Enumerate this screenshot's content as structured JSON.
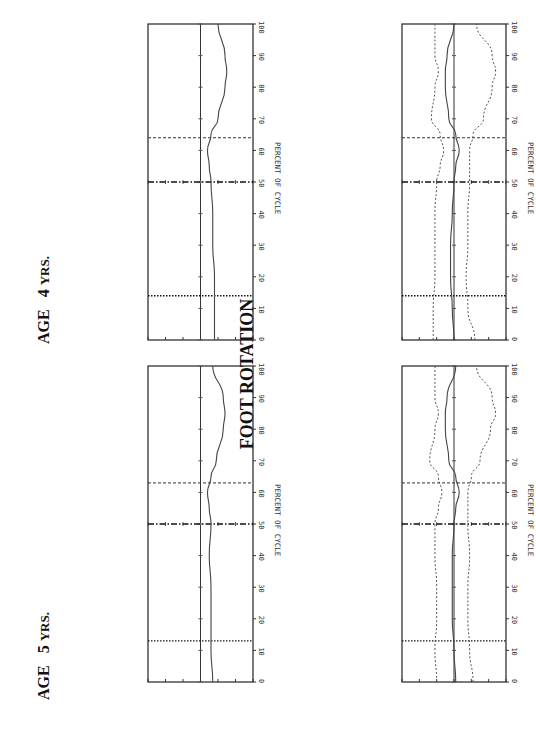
{
  "title": "FOOT ROTATION",
  "age_labels": [
    {
      "age": "AGE",
      "value": "4",
      "unit": "YRS."
    },
    {
      "age": "AGE",
      "value": "5",
      "unit": "YRS."
    }
  ],
  "axis": {
    "ylabel": "ANGLE   (DEGREES)",
    "xlabel": "PERCENT OF CYCLE",
    "y_ticks": [
      "30",
      "20",
      "10",
      "0",
      "-10",
      "-20",
      "-30"
    ],
    "x_ticks": [
      "0",
      "10",
      "20",
      "30",
      "40",
      "50",
      "60",
      "70",
      "80",
      "90",
      "100"
    ]
  },
  "chart_data": [
    {
      "type": "line",
      "title": "FOOT ROTATION — AGE 4 YRS. (mean)",
      "xlabel": "PERCENT OF CYCLE",
      "ylabel": "ANGLE (DEGREES)",
      "xlim": [
        0,
        100
      ],
      "ylim": [
        -30,
        30
      ],
      "event_lines": {
        "toe_off_opposite": 14,
        "heel_strike_opposite": 50,
        "toe_off": 64
      },
      "x": [
        0,
        10,
        20,
        30,
        40,
        50,
        55,
        60,
        65,
        70,
        80,
        85,
        90,
        100
      ],
      "series": [
        {
          "name": "mean",
          "values": [
            -8,
            -8,
            -8,
            -7,
            -7,
            -6,
            -5,
            -4,
            -6,
            -10,
            -14,
            -15,
            -14,
            -10
          ]
        }
      ]
    },
    {
      "type": "line",
      "title": "FOOT ROTATION — AGE 4 YRS. (mean ± 2 SD)",
      "xlabel": "PERCENT OF CYCLE",
      "ylabel": "ANGLE (DEGREES)",
      "xlim": [
        0,
        100
      ],
      "ylim": [
        -30,
        30
      ],
      "event_lines": {
        "toe_off_opposite": 14,
        "heel_strike_opposite": 50,
        "toe_off": 64
      },
      "x": [
        0,
        10,
        20,
        30,
        40,
        50,
        55,
        60,
        65,
        70,
        80,
        85,
        90,
        100
      ],
      "series": [
        {
          "name": "mean",
          "values": [
            0,
            1,
            2,
            2,
            1,
            0,
            -1,
            -3,
            -1,
            3,
            5,
            5,
            4,
            0
          ]
        },
        {
          "name": "upper",
          "values": [
            12,
            12,
            11,
            11,
            11,
            10,
            8,
            6,
            8,
            13,
            11,
            9,
            11,
            11
          ]
        },
        {
          "name": "lower",
          "values": [
            -12,
            -8,
            -7,
            -8,
            -8,
            -9,
            -9,
            -9,
            -11,
            -17,
            -22,
            -24,
            -22,
            -13
          ]
        }
      ]
    },
    {
      "type": "line",
      "title": "FOOT ROTATION — AGE 5 YRS. (mean)",
      "xlabel": "PERCENT OF CYCLE",
      "ylabel": "ANGLE (DEGREES)",
      "xlim": [
        0,
        100
      ],
      "ylim": [
        -30,
        30
      ],
      "event_lines": {
        "toe_off_opposite": 13,
        "heel_strike_opposite": 50,
        "toe_off": 63
      },
      "x": [
        0,
        10,
        20,
        30,
        40,
        50,
        55,
        60,
        65,
        70,
        80,
        85,
        90,
        100
      ],
      "series": [
        {
          "name": "mean",
          "values": [
            -7,
            -6,
            -6,
            -6,
            -5,
            -6,
            -5,
            -4,
            -6,
            -9,
            -13,
            -14,
            -13,
            -7
          ]
        }
      ]
    },
    {
      "type": "line",
      "title": "FOOT ROTATION — AGE 5 YRS. (mean ± 2 SD)",
      "xlabel": "PERCENT OF CYCLE",
      "ylabel": "ANGLE (DEGREES)",
      "xlim": [
        0,
        100
      ],
      "ylim": [
        -30,
        30
      ],
      "event_lines": {
        "toe_off_opposite": 13,
        "heel_strike_opposite": 50,
        "toe_off": 63
      },
      "x": [
        0,
        10,
        20,
        30,
        40,
        50,
        55,
        60,
        65,
        70,
        80,
        85,
        90,
        100
      ],
      "series": [
        {
          "name": "mean",
          "values": [
            -1,
            0,
            1,
            1,
            1,
            0,
            -1,
            -3,
            -1,
            3,
            5,
            5,
            4,
            -1
          ]
        },
        {
          "name": "upper",
          "values": [
            10,
            11,
            10,
            10,
            11,
            11,
            9,
            7,
            9,
            14,
            11,
            9,
            11,
            11
          ]
        },
        {
          "name": "lower",
          "values": [
            -11,
            -9,
            -8,
            -8,
            -9,
            -8,
            -8,
            -8,
            -10,
            -15,
            -21,
            -24,
            -22,
            -13
          ]
        }
      ]
    }
  ]
}
